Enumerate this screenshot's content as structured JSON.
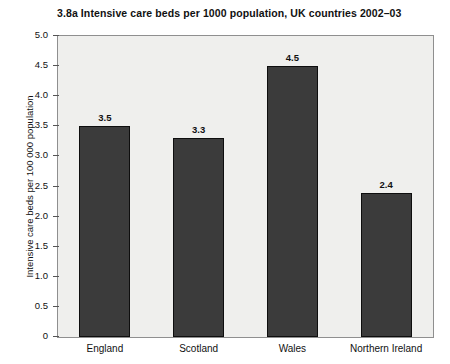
{
  "chart_data": {
    "type": "bar",
    "title": "3.8a  Intensive care beds per 1000 population, UK countries 2002–03",
    "xlabel": "",
    "ylabel": "Intensive care beds per 100 000 population",
    "categories": [
      "England",
      "Scotland",
      "Wales",
      "Northern Ireland"
    ],
    "values": [
      3.5,
      3.3,
      4.5,
      2.4
    ],
    "value_labels": [
      "3.5",
      "3.3",
      "4.5",
      "2.4"
    ],
    "ylim": [
      0,
      5.0
    ],
    "ytick_values": [
      0,
      0.5,
      1.0,
      1.5,
      2.0,
      2.5,
      3.0,
      3.5,
      4.0,
      4.5,
      5.0
    ],
    "ytick_labels": [
      "0",
      "0.5",
      "1.0",
      "1.5",
      "2.0",
      "2.5",
      "3.0",
      "3.5",
      "4.0",
      "4.5",
      "5.0"
    ],
    "grid": false,
    "legend": false,
    "colors": {
      "bar_fill": "#3b3b3b",
      "bar_edge": "#0e0e0e",
      "plot_background": "#efefed",
      "frame": "#8f8f8f",
      "text": "#111111",
      "page_background": "#ffffff"
    }
  }
}
